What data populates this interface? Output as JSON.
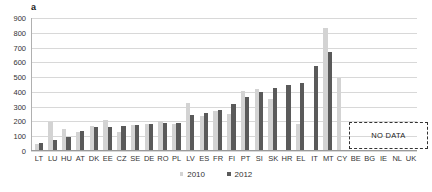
{
  "chart_data": {
    "type": "bar",
    "title": "a",
    "xlabel": "",
    "ylabel": "",
    "ylim": [
      0,
      900
    ],
    "ytick_step": 100,
    "yticks": [
      900,
      800,
      700,
      600,
      500,
      400,
      300,
      200,
      100,
      0
    ],
    "grid": true,
    "legend_position": "bottom-center",
    "categories": [
      "LT",
      "LU",
      "HU",
      "AT",
      "DK",
      "EE",
      "CZ",
      "SE",
      "DE",
      "RO",
      "PL",
      "LV",
      "ES",
      "FR",
      "FI",
      "PT",
      "SI",
      "SK",
      "HR",
      "EL",
      "IT",
      "MT",
      "CY",
      "BE",
      "BG",
      "IE",
      "NL",
      "UK"
    ],
    "series": [
      {
        "name": "2010",
        "color": "#d3d3d3",
        "values": [
          48,
          193,
          150,
          128,
          168,
          210,
          128,
          175,
          182,
          203,
          180,
          322,
          238,
          270,
          253,
          405,
          418,
          350,
          null,
          185,
          null,
          833,
          497,
          null,
          null,
          null,
          null,
          null
        ]
      },
      {
        "name": "2012",
        "color": "#5a5a5a",
        "values": [
          55,
          75,
          97,
          133,
          165,
          163,
          172,
          177,
          182,
          192,
          192,
          245,
          258,
          277,
          320,
          363,
          397,
          425,
          447,
          458,
          577,
          673,
          null,
          null,
          null,
          null,
          null,
          null
        ]
      }
    ],
    "annotations": [
      {
        "text": "NO DATA",
        "covers": [
          "CY",
          "BE",
          "BG",
          "IE",
          "NL",
          "UK"
        ],
        "style": "dashed-box"
      }
    ]
  },
  "no_data": {
    "label": "NO DATA"
  },
  "legend": {
    "items": [
      {
        "label": "2010"
      },
      {
        "label": "2012"
      }
    ]
  },
  "footer": {
    "tick": ""
  }
}
